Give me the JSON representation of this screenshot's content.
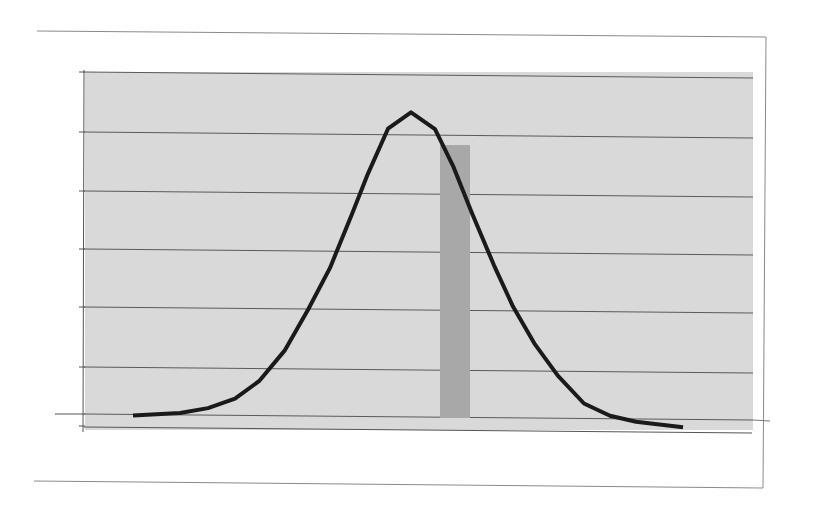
{
  "colors": {
    "background": "#ffffff",
    "frame": "#8a8a8a",
    "plot_area": "#d9d9d9",
    "gridline": "#5a5a5a",
    "curve": "#1a1a1a",
    "bar": "#a8a8a8"
  },
  "chart_data": {
    "type": "line",
    "title": "",
    "xlabel": "",
    "ylabel": "",
    "grid": true,
    "legend": null,
    "ylim": [
      0,
      6
    ],
    "xlim": [
      0,
      22
    ],
    "series": [
      {
        "name": "normal-curve",
        "style": "line",
        "x": [
          0,
          1,
          2,
          3,
          4,
          5,
          6,
          7,
          8,
          9,
          10,
          11,
          12,
          13,
          14,
          15,
          16,
          17,
          18,
          19,
          20,
          21,
          22
        ],
        "values": [
          0.0,
          0.05,
          0.14,
          0.31,
          0.62,
          1.17,
          1.88,
          2.62,
          3.57,
          4.28,
          5.07,
          5.36,
          5.07,
          4.43,
          3.6,
          2.69,
          1.97,
          1.31,
          0.76,
          0.28,
          0.07,
          -0.03,
          -0.12
        ]
      },
      {
        "name": "highlight-bar",
        "style": "bar",
        "x_range": [
          12.2,
          13.4
        ],
        "value": 4.85
      }
    ],
    "plot_px": {
      "left": 84,
      "right": 753,
      "top": 72,
      "baseline": 414,
      "bottom": 430
    },
    "curve_px_x": [
      133,
      180,
      208,
      235,
      259,
      285,
      308,
      330,
      352,
      368,
      388,
      411,
      435,
      453,
      472,
      494,
      513,
      535,
      558,
      584,
      610,
      636,
      683
    ],
    "bar_px": {
      "x": 440,
      "width": 30,
      "top": 145,
      "bottom": 418
    },
    "gridlines_px_y": [
      72,
      132,
      191,
      249,
      307,
      367,
      414
    ]
  }
}
